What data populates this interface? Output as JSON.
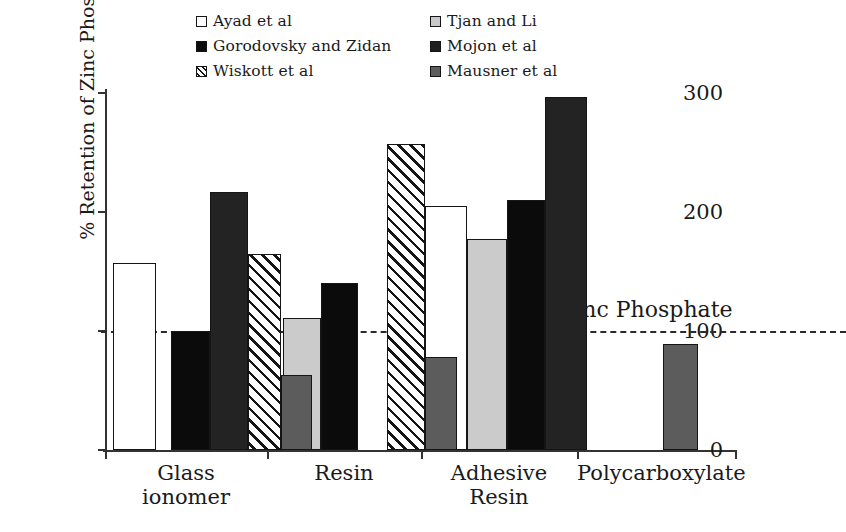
{
  "chart_data": {
    "type": "bar",
    "title": "",
    "xlabel": "",
    "ylabel": "% Retention of Zinc Phosphate",
    "ylim": [
      0,
      300
    ],
    "yticks": [
      0,
      100,
      200,
      300
    ],
    "grid": false,
    "legend_position": "top",
    "categories": [
      "Glass ionomer",
      "Resin",
      "Adhesive Resin",
      "Polycarboxylate"
    ],
    "category_lines": [
      [
        "Glass",
        "ionomer"
      ],
      [
        "Resin"
      ],
      [
        "Adhesive",
        "Resin"
      ],
      [
        "Polycarboxylate"
      ]
    ],
    "series": [
      {
        "name": "Ayad et al",
        "style": "white",
        "values": [
          157,
          null,
          205,
          null
        ]
      },
      {
        "name": "Tjan and Li",
        "style": "ltgray",
        "values": [
          null,
          111,
          177,
          null
        ]
      },
      {
        "name": "Gorodovsky and Zidan",
        "style": "black",
        "values": [
          100,
          140,
          210,
          null
        ]
      },
      {
        "name": "Mojon et al",
        "style": "dark",
        "values": [
          217,
          null,
          297,
          null
        ]
      },
      {
        "name": "Wiskott et al",
        "style": "hatch",
        "values": [
          165,
          257,
          null,
          null
        ]
      },
      {
        "name": "Mausner et al",
        "style": "mdgray",
        "values": [
          63,
          78,
          null,
          89
        ]
      }
    ],
    "reference_line": {
      "value": 100,
      "label": "Zinc Phosphate",
      "style": "dashed"
    }
  },
  "legend": {
    "items": [
      {
        "label": "Ayad et al",
        "swatch": "white",
        "column": "a",
        "row": 0
      },
      {
        "label": "Gorodovsky and Zidan",
        "swatch": "black",
        "column": "a",
        "row": 1
      },
      {
        "label": "Wiskott et al",
        "swatch": "hatch",
        "column": "a",
        "row": 2
      },
      {
        "label": "Tjan and Li",
        "swatch": "ltgray",
        "column": "b",
        "row": 0
      },
      {
        "label": "Mojon et al",
        "swatch": "dark",
        "column": "b",
        "row": 1
      },
      {
        "label": "Mausner et al",
        "swatch": "mdgray",
        "column": "b",
        "row": 2
      }
    ]
  },
  "axis": {
    "y_title": "% Retention of Zinc Phosphate",
    "y_tick_labels": [
      "0",
      "100",
      "200",
      "300"
    ]
  },
  "annotation": {
    "zinc_phosphate_label": "Zinc Phosphate"
  },
  "colors": {
    "white": "#ffffff",
    "light_gray": "#cbcbcb",
    "medium_gray": "#5c5c5c",
    "dark": "#232323",
    "black": "#0b0b0b",
    "outline": "#151515",
    "axis": "#333333"
  }
}
